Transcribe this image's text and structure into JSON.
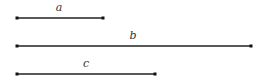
{
  "diagram": {
    "line_color": "#222222",
    "segments": [
      {
        "label": "a",
        "x1": 17,
        "x2": 103,
        "y": 18,
        "label_x": 59,
        "label_y": 11
      },
      {
        "label": "b",
        "x1": 17,
        "x2": 251,
        "y": 46,
        "label_x": 133,
        "label_y": 39
      },
      {
        "label": "c",
        "x1": 17,
        "x2": 155,
        "y": 74,
        "label_x": 86,
        "label_y": 67
      }
    ]
  }
}
